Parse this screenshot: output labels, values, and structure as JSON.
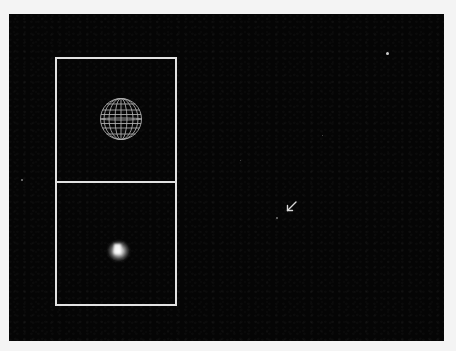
{
  "figure": {
    "colors": {
      "page_background": "#f4f4f4",
      "sky_background": "#050505",
      "inset_border": "#e2e2e2",
      "sphere_wireframe": "#bdbdbd",
      "arrow": "#d8d8d8"
    },
    "insets": [
      {
        "id": "top",
        "content": "wireframe-sphere-model"
      },
      {
        "id": "bottom",
        "content": "blurred-point-source"
      }
    ],
    "annotations": [
      {
        "type": "arrow",
        "direction": "down-left",
        "target": "faint-object"
      }
    ],
    "stars": [
      {
        "x": 387,
        "y": 53,
        "size": 3
      },
      {
        "x": 22,
        "y": 180,
        "size": 2
      },
      {
        "x": 277,
        "y": 218,
        "size": 2
      }
    ]
  }
}
